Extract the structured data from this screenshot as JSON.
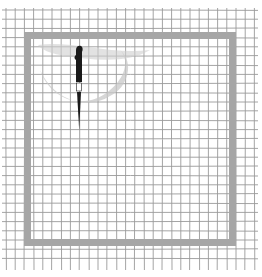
{
  "illustration": {
    "description": "Hand-drawn grid paper with a gray square frame, faint gray crescent and a black dagger",
    "colors": {
      "background": "#ffffff",
      "grid_line": "#9a9a9a",
      "frame": "#a6a6a6",
      "crescent": "#c8c8c8",
      "knife": "#1a1a1a"
    },
    "grid": {
      "origin_x": 6,
      "origin_y": 10,
      "spacing": 9.2,
      "cols": 28,
      "rows": 28
    },
    "frame": {
      "x": 24,
      "y": 32,
      "width": 212,
      "height": 214,
      "stroke": 7
    },
    "knife": {
      "x": 79,
      "top": 46,
      "bottom": 130
    }
  }
}
